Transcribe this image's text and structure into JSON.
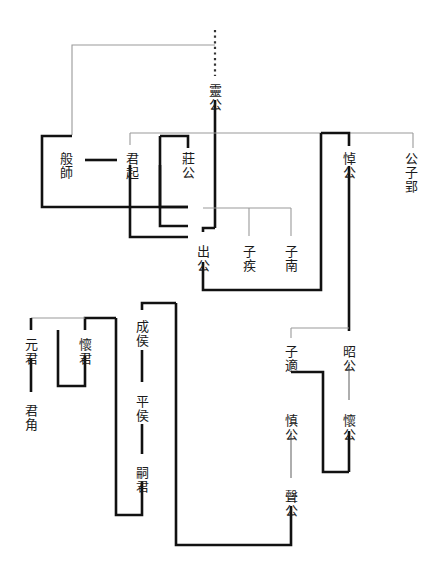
{
  "diagram": {
    "type": "genealogy-tree",
    "orientation": "vertical-text-chinese",
    "colors": {
      "background": "#ffffff",
      "text": "#1a1a1a",
      "thick_line": "#111111",
      "thin_line": "#9a9a9a",
      "dotted_line": "#333333"
    },
    "nodes": [
      {
        "id": "ling-gong",
        "label": "靈公",
        "x": 215,
        "y": 84
      },
      {
        "id": "ban-shi",
        "label": "般師",
        "x": 66,
        "y": 152
      },
      {
        "id": "jun-qi",
        "label": "君起",
        "x": 132,
        "y": 152
      },
      {
        "id": "zhuang-gong",
        "label": "莊公",
        "x": 188,
        "y": 152
      },
      {
        "id": "dao-gong",
        "label": "悼公",
        "x": 349,
        "y": 152
      },
      {
        "id": "gongzi-ying",
        "label": "公子郢",
        "x": 411,
        "y": 152
      },
      {
        "id": "chu-gong",
        "label": "出公",
        "x": 203,
        "y": 245
      },
      {
        "id": "zi-ji",
        "label": "子疾",
        "x": 249,
        "y": 245
      },
      {
        "id": "zi-nan",
        "label": "子南",
        "x": 291,
        "y": 245
      },
      {
        "id": "yuan-jun",
        "label": "元君",
        "x": 31,
        "y": 338
      },
      {
        "id": "huai-jun",
        "label": "懷君",
        "x": 85,
        "y": 338
      },
      {
        "id": "jun-jiao",
        "label": "君角",
        "x": 31,
        "y": 404
      },
      {
        "id": "cheng-hou",
        "label": "成侯",
        "x": 142,
        "y": 320
      },
      {
        "id": "ping-hou",
        "label": "平侯",
        "x": 142,
        "y": 395
      },
      {
        "id": "si-jun",
        "label": "嗣君",
        "x": 142,
        "y": 466
      },
      {
        "id": "zi-shi",
        "label": "子適",
        "x": 291,
        "y": 345
      },
      {
        "id": "zhao-gong",
        "label": "昭公",
        "x": 349,
        "y": 345
      },
      {
        "id": "shen-gong",
        "label": "慎公",
        "x": 291,
        "y": 414
      },
      {
        "id": "huai-gong",
        "label": "懷公",
        "x": 349,
        "y": 414
      },
      {
        "id": "sheng-gong",
        "label": "聲公",
        "x": 291,
        "y": 490
      }
    ],
    "edges": [
      {
        "id": "dotted-ling-top",
        "style": "dotted"
      },
      {
        "id": "ling-to-siblings",
        "style": "thin"
      },
      {
        "id": "banshi-bracket",
        "style": "thick"
      },
      {
        "id": "junqi-marriage",
        "style": "thick"
      },
      {
        "id": "zhuanggong-bracket",
        "style": "thick"
      },
      {
        "id": "daogong-bracket",
        "style": "thick"
      },
      {
        "id": "chugong-generation",
        "style": "thin"
      },
      {
        "id": "lower-left-bracket",
        "style": "thick"
      },
      {
        "id": "zishi-zhaogong",
        "style": "thin"
      },
      {
        "id": "chenghou-line",
        "style": "thick"
      }
    ]
  }
}
